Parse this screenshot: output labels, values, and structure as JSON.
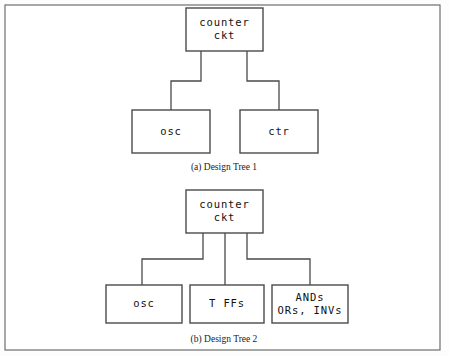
{
  "figure": {
    "background_color": "#fdfdfd",
    "frame_color": "#6e6e6e",
    "box_stroke_color": "#4a4a4a",
    "text_color": "#111111",
    "frame": {
      "x": 5,
      "y": 5,
      "width": 435,
      "height": 345
    }
  },
  "diagrams": [
    {
      "id": "design-tree-1",
      "caption": "(a) Design Tree 1",
      "caption_x": 224,
      "caption_y": 168,
      "root": {
        "name": "counter-ckt",
        "lines": [
          "counter",
          "ckt"
        ],
        "x": 186,
        "y": 8,
        "width": 77,
        "height": 43
      },
      "children": [
        {
          "name": "osc",
          "lines": [
            "osc"
          ],
          "x": 132,
          "y": 110,
          "width": 78,
          "height": 43
        },
        {
          "name": "ctr",
          "lines": [
            "ctr"
          ],
          "x": 240,
          "y": 110,
          "width": 78,
          "height": 43
        }
      ],
      "connectors": [
        "M 201 51 L 201 81 L 171 81 L 171 110",
        "M 247 51 L 247 81 L 279 81 L 279 110"
      ]
    },
    {
      "id": "design-tree-2",
      "caption": "(b) Design Tree 2",
      "caption_x": 224,
      "caption_y": 340,
      "root": {
        "name": "counter-ckt",
        "lines": [
          "counter",
          "ckt"
        ],
        "x": 186,
        "y": 190,
        "width": 77,
        "height": 43
      },
      "children": [
        {
          "name": "osc",
          "lines": [
            "osc"
          ],
          "x": 106,
          "y": 285,
          "width": 76,
          "height": 38
        },
        {
          "name": "t-ffs",
          "lines": [
            "T FFs"
          ],
          "x": 190,
          "y": 285,
          "width": 74,
          "height": 38
        },
        {
          "name": "ands-ors-invs",
          "lines": [
            "ANDs",
            "ORs, INVs"
          ],
          "x": 272,
          "y": 285,
          "width": 76,
          "height": 38
        }
      ],
      "connectors": [
        "M 203 233 L 203 259 L 142 259 L 142 285",
        "M 225 233 L 225 285",
        "M 247 233 L 247 259 L 310 259 L 310 285"
      ]
    }
  ]
}
